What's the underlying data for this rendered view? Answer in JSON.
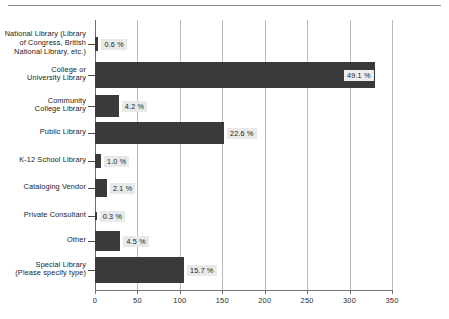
{
  "chart_data": {
    "type": "bar",
    "orientation": "horizontal",
    "title": "",
    "subtitle": "",
    "xlabel": "",
    "ylabel": "",
    "xlim": [
      0,
      350
    ],
    "xticks": [
      0,
      50,
      100,
      150,
      200,
      250,
      300,
      350
    ],
    "xtick_labels": [
      "0",
      "50",
      "100",
      "150",
      "200",
      "250",
      "300",
      "350"
    ],
    "grid": true,
    "grid_axis": "x",
    "legend": false,
    "legend_position": "none",
    "value_label_suffix": "%",
    "categories": [
      "National Library (Library of Congress, British National Library, etc.)",
      "College or University Library",
      "Community College Library",
      "Public Library",
      "K-12 School Library",
      "Cataloging Vendor",
      "Private Consultant",
      "Other",
      "Special Library (Please specify type)"
    ],
    "category_lines": [
      [
        "National Library (Library",
        "of Congress, British",
        "National Library, etc.)"
      ],
      [
        "College or",
        "University Library"
      ],
      [
        "Community",
        "College Library"
      ],
      [
        "Public Library"
      ],
      [
        "K-12 School Library"
      ],
      [
        "Cataloging Vendor"
      ],
      [
        "Private Consultant"
      ],
      [
        "Other"
      ],
      [
        "Special Library",
        "(Please specify type)"
      ]
    ],
    "values": [
      4,
      330,
      28,
      152,
      7,
      14,
      2,
      30,
      105
    ],
    "percent_values": [
      0.6,
      49.1,
      4.2,
      22.6,
      1.0,
      2.1,
      0.3,
      4.5,
      15.7
    ],
    "data_labels": [
      "0.6 %",
      "49.1 %",
      "4.2 %",
      "22.6 %",
      "1.0 %",
      "2.1 %",
      "0.3 %",
      "4.5 %",
      "15.7 %"
    ],
    "colors": {
      "bar": "#3a3a3a",
      "gridline": "#b9b9b9",
      "axis": "#6f6f6f",
      "label_background": "#e9e9e9",
      "text": "#1b1b1b",
      "background": "#ffffff",
      "top_rule": "#8d8d8d"
    }
  }
}
